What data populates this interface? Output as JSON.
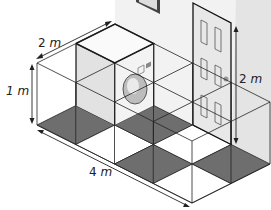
{
  "figure": {
    "labels": {
      "depth": {
        "value": "2",
        "unit": "m"
      },
      "height": {
        "value": "1",
        "unit": "m"
      },
      "length": {
        "value": "4",
        "unit": "m"
      },
      "door_height": {
        "value": "2",
        "unit": "m"
      }
    },
    "grid": {
      "length_m": 4,
      "depth_m": 2,
      "height_m": 1
    },
    "objects": [
      "washing-machine",
      "door",
      "picture-frame"
    ],
    "colors": {
      "floor_dark": "#6e6e6e",
      "floor_light": "#ffffff",
      "wall": "#eeeeee",
      "lines": "#222222",
      "machine_face": "#e9e9e9"
    }
  }
}
